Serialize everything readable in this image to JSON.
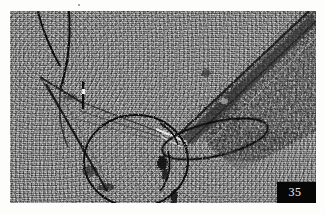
{
  "figure": {
    "number_label": "35",
    "caption": "",
    "plate": {
      "left": 10,
      "top": 11,
      "width": 306,
      "height": 192
    },
    "page_background": "#fdfdfb",
    "label_box": {
      "background": "#070707",
      "text_color": "#f2f2f2",
      "position": "bottom-right"
    }
  },
  "micrograph": {
    "modality": "transmission-electron-micrograph",
    "base_gray": "#8c8c8c",
    "dark_gray": "#2a2a2a",
    "filament_color": "#141414",
    "highlight_color": "#f0f0ee",
    "description": "Grainy grayscale electron micrograph showing dark curved filaments, two closed loop structures and a coarse diagonal fibrous band in the upper right.",
    "features": [
      {
        "name": "upper-left-filament-outer",
        "type": "curved-filament",
        "path": "M 30 2 C 36 22, 44 40, 52 56"
      },
      {
        "name": "upper-left-filament-inner",
        "type": "curved-filament",
        "path": "M 58 0 C 60 26, 58 52, 52 74"
      },
      {
        "name": "angular-v-structure",
        "type": "angular-edge",
        "path": "M 30 66 L 72 92 L 92 104"
      },
      {
        "name": "long-left-edge",
        "type": "straight-edge",
        "path": "M 36 72 L 95 178"
      },
      {
        "name": "large-loop",
        "type": "closed-loop",
        "cx": 125,
        "cy": 150,
        "rx": 52,
        "ry": 46
      },
      {
        "name": "narrow-right-loop",
        "type": "closed-loop",
        "cx": 205,
        "cy": 128,
        "rx": 54,
        "ry": 17,
        "rotation": -14
      },
      {
        "name": "diagonal-fibrous-band",
        "type": "fibrous-band",
        "path": "M 300 6 L 168 128"
      },
      {
        "name": "dark-granular-field",
        "type": "granular-region",
        "region": "upper-right"
      },
      {
        "name": "bright-highlight-streak",
        "type": "highlight",
        "path": "M 150 120 L 178 132"
      }
    ]
  }
}
